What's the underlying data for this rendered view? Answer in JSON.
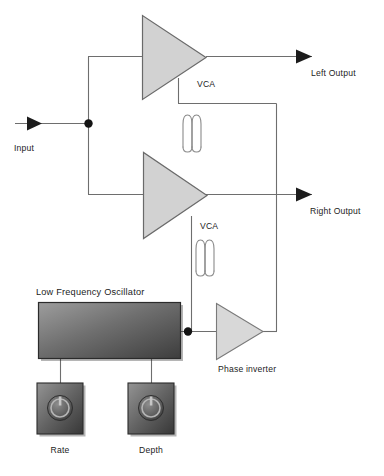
{
  "diagram": {
    "background_color": "#ffffff",
    "wire_color": "#6e6e6e",
    "text_color": "#1c1c1c",
    "triangle_fill": "#d2d2d2",
    "triangle_stroke": "#6a6a6a",
    "panel_gradient_light": "#9a9a9a",
    "panel_gradient_dark": "#3f3f3f",
    "knob_gradient_light": "#8f8f8f",
    "knob_gradient_dark": "#3a3a3a"
  },
  "nodes": {
    "input": {
      "label": "Input",
      "type": "signal-input-arrow"
    },
    "vca_top": {
      "label": "VCA",
      "type": "amplifier-triangle"
    },
    "vca_bottom": {
      "label": "VCA",
      "type": "amplifier-triangle"
    },
    "left_output": {
      "label": "Left Output",
      "type": "signal-output-arrow"
    },
    "right_output": {
      "label": "Right Output",
      "type": "signal-output-arrow"
    },
    "lfo": {
      "label": "Low Frequency Oscillator",
      "type": "panel-block"
    },
    "phase_inverter": {
      "label": "Phase inverter",
      "type": "amplifier-triangle"
    },
    "rate_knob": {
      "label": "Rate",
      "type": "knob-control",
      "icon": "power-knob-icon"
    },
    "depth_knob": {
      "label": "Depth",
      "type": "knob-control",
      "icon": "power-knob-icon"
    }
  },
  "symbols": {
    "modulation_wave_top": "oscillation-waveform-icon",
    "modulation_wave_bottom": "oscillation-waveform-icon"
  },
  "junctions": {
    "input_split": "input-signal-split-dot",
    "lfo_split": "lfo-output-split-dot"
  }
}
